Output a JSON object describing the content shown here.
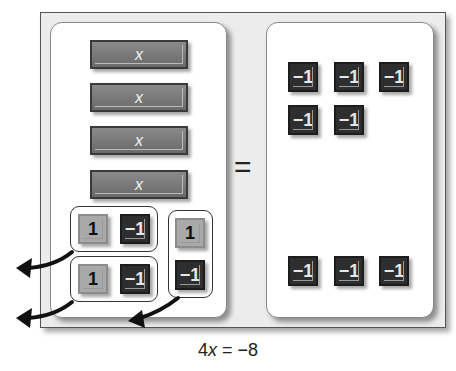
{
  "diagram": {
    "left_side": {
      "x_tiles": [
        {
          "label": "x"
        },
        {
          "label": "x"
        },
        {
          "label": "x"
        },
        {
          "label": "x"
        }
      ],
      "zero_pairs": [
        {
          "orientation": "horizontal",
          "tiles": [
            "1",
            "−1"
          ]
        },
        {
          "orientation": "horizontal",
          "tiles": [
            "1",
            "−1"
          ]
        },
        {
          "orientation": "vertical",
          "tiles": [
            "1",
            "−1"
          ]
        }
      ],
      "removal_arrows": 3
    },
    "equals_sign": "=",
    "right_side": {
      "unit_tiles": [
        "−1",
        "−1",
        "−1",
        "−1",
        "−1",
        "−1",
        "−1",
        "−1"
      ]
    },
    "colors": {
      "x_tile": "#787878",
      "positive_tile": "#a9a9a9",
      "negative_tile": "#2e2e2e",
      "frame": "#ececec"
    }
  },
  "caption": {
    "coef": "4",
    "var": "x",
    "rest": " = −8"
  }
}
